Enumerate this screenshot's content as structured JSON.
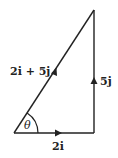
{
  "diagram": {
    "type": "vector-triangle",
    "colors": {
      "line": "#222222",
      "background": "#ffffff"
    },
    "vertices": {
      "origin": {
        "x": 14,
        "y": 133
      },
      "right_corner": {
        "x": 94,
        "y": 133
      },
      "top": {
        "x": 94,
        "y": 10
      }
    },
    "vectors": [
      {
        "name": "horizontal",
        "label": "2i",
        "from": "origin",
        "to": "right_corner"
      },
      {
        "name": "vertical",
        "label": "5j",
        "from": "right_corner",
        "to": "top"
      },
      {
        "name": "resultant",
        "label": "2i + 5j",
        "from": "origin",
        "to": "top"
      }
    ],
    "angle": {
      "label": "θ",
      "at": "origin"
    }
  }
}
